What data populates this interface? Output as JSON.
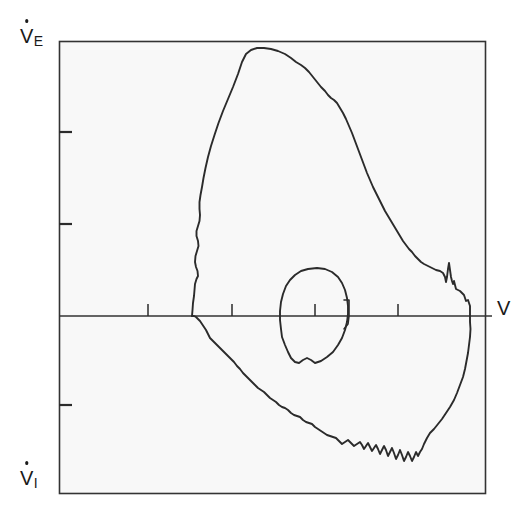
{
  "figure": {
    "background_color": "#ffffff",
    "plot_background_color": "#f8f8f8",
    "line_color": "#2b2b2b"
  },
  "labels": {
    "y_axis_positive": {
      "base": "V",
      "subscript": "E",
      "dot": true,
      "full": "V̇E"
    },
    "y_axis_negative": {
      "base": "V",
      "subscript": "I",
      "dot": true,
      "full": "V̇I"
    },
    "x_axis": {
      "base": "V",
      "subscript": "",
      "dot": false,
      "full": "V"
    }
  },
  "chart_data": {
    "type": "line",
    "xlabel": "V",
    "ylabel": "V̇E / V̇I",
    "grid": false,
    "legend": "none",
    "xlim": [
      59,
      486
    ],
    "ylim": [
      494,
      41
    ],
    "zero_axis_y": 316,
    "plot_box": {
      "x0": 59,
      "y0": 41,
      "x1": 486,
      "y1": 494
    },
    "axis_extension_right_x": 492,
    "y_ticks": [
      {
        "y": 132,
        "length": 13,
        "labeled": false
      },
      {
        "y": 224,
        "length": 13,
        "labeled": false
      },
      {
        "y": 405,
        "length": 13,
        "labeled": false
      }
    ],
    "x_ticks": [
      {
        "x": 148,
        "length": 12,
        "labeled": false
      },
      {
        "x": 232,
        "length": 12,
        "labeled": false
      },
      {
        "x": 315,
        "length": 12,
        "labeled": false
      },
      {
        "x": 398,
        "length": 12,
        "labeled": false
      }
    ],
    "marker": {
      "name": "tidal-volume-bracket",
      "path": "M 344 300 L 349 300 L 349 316 L 348 324 L 344 329"
    },
    "series": [
      {
        "name": "expiratory-limb",
        "description": "Forced expiratory flow, above zero axis",
        "points": [
          [
            192,
            316
          ],
          [
            192.5,
            310
          ],
          [
            193,
            303
          ],
          [
            194,
            296
          ],
          [
            194.5,
            290
          ],
          [
            195,
            284
          ],
          [
            196.5,
            279
          ],
          [
            198,
            276
          ],
          [
            197.5,
            271
          ],
          [
            196,
            267
          ],
          [
            195,
            262
          ],
          [
            195.5,
            256
          ],
          [
            197,
            251
          ],
          [
            198.5,
            246
          ],
          [
            198,
            241
          ],
          [
            196.5,
            236
          ],
          [
            196.5,
            231
          ],
          [
            198,
            226
          ],
          [
            199.5,
            221
          ],
          [
            200,
            215
          ],
          [
            199.5,
            209
          ],
          [
            199.5,
            202
          ],
          [
            200.5,
            195
          ],
          [
            202,
            187
          ],
          [
            203.5,
            178
          ],
          [
            205.5,
            168
          ],
          [
            208,
            157
          ],
          [
            211,
            146
          ],
          [
            214.5,
            135
          ],
          [
            218.5,
            123
          ],
          [
            223,
            111
          ],
          [
            228,
            99
          ],
          [
            233,
            87
          ],
          [
            238,
            74
          ],
          [
            242,
            62
          ],
          [
            246,
            54
          ],
          [
            251,
            50
          ],
          [
            257,
            48
          ],
          [
            264,
            48
          ],
          [
            271,
            49
          ],
          [
            278,
            51
          ],
          [
            285,
            54
          ],
          [
            291,
            58
          ],
          [
            296,
            62
          ],
          [
            301,
            65
          ],
          [
            305,
            68
          ],
          [
            309,
            72
          ],
          [
            313,
            77
          ],
          [
            317,
            82
          ],
          [
            321,
            87
          ],
          [
            325,
            91
          ],
          [
            328,
            95
          ],
          [
            331,
            98
          ],
          [
            334,
            100
          ],
          [
            337,
            103
          ],
          [
            340,
            108
          ],
          [
            343,
            113
          ],
          [
            346,
            119
          ],
          [
            349,
            126
          ],
          [
            352,
            133
          ],
          [
            355,
            141
          ],
          [
            358,
            149
          ],
          [
            361,
            157
          ],
          [
            364,
            165
          ],
          [
            367,
            173
          ],
          [
            370,
            180
          ],
          [
            373,
            187
          ],
          [
            376,
            193
          ],
          [
            379,
            199
          ],
          [
            382,
            205
          ],
          [
            385,
            211
          ],
          [
            388,
            216
          ],
          [
            391,
            221
          ],
          [
            394,
            226
          ],
          [
            397,
            231
          ],
          [
            400,
            236
          ],
          [
            403,
            241
          ],
          [
            406,
            245
          ],
          [
            409,
            249
          ],
          [
            412,
            252
          ],
          [
            415,
            256
          ],
          [
            418,
            259
          ],
          [
            421,
            262
          ],
          [
            424,
            264
          ],
          [
            428,
            266
          ],
          [
            432,
            268
          ],
          [
            436,
            270
          ],
          [
            440,
            271
          ],
          [
            443,
            273
          ],
          [
            445,
            277
          ],
          [
            446,
            282
          ],
          [
            447,
            277
          ],
          [
            448,
            269
          ],
          [
            449,
            263
          ],
          [
            450,
            270
          ],
          [
            451,
            277
          ],
          [
            452,
            281
          ],
          [
            453,
            284
          ],
          [
            454,
            281
          ],
          [
            455,
            285
          ],
          [
            456,
            289
          ],
          [
            458,
            290
          ],
          [
            460,
            291
          ],
          [
            462,
            293
          ],
          [
            464,
            295
          ],
          [
            465,
            298
          ],
          [
            466,
            301
          ],
          [
            468,
            300
          ],
          [
            469,
            303
          ],
          [
            470,
            306
          ],
          [
            470,
            310
          ],
          [
            470,
            316
          ]
        ]
      },
      {
        "name": "inspiratory-limb",
        "description": "Inspiratory flow, below zero axis",
        "points": [
          [
            470,
            316
          ],
          [
            470,
            322
          ],
          [
            470.5,
            329
          ],
          [
            470,
            337
          ],
          [
            469,
            345
          ],
          [
            468,
            353
          ],
          [
            466.5,
            361
          ],
          [
            465,
            369
          ],
          [
            463,
            377
          ],
          [
            460,
            385
          ],
          [
            457,
            393
          ],
          [
            454,
            400
          ],
          [
            450,
            407
          ],
          [
            446,
            413
          ],
          [
            442,
            419
          ],
          [
            438,
            424
          ],
          [
            434,
            429
          ],
          [
            430,
            433
          ],
          [
            427,
            438
          ],
          [
            424,
            444
          ],
          [
            422,
            449
          ],
          [
            420,
            452
          ],
          [
            418,
            456
          ],
          [
            416,
            452
          ],
          [
            414,
            457
          ],
          [
            412,
            461
          ],
          [
            410,
            456
          ],
          [
            408,
            452
          ],
          [
            406,
            457
          ],
          [
            404,
            461
          ],
          [
            402,
            455
          ],
          [
            400,
            450
          ],
          [
            398,
            455
          ],
          [
            396,
            459
          ],
          [
            394,
            453
          ],
          [
            392,
            448
          ],
          [
            390,
            452
          ],
          [
            388,
            456
          ],
          [
            386,
            450
          ],
          [
            384,
            446
          ],
          [
            382,
            450
          ],
          [
            380,
            454
          ],
          [
            378,
            449
          ],
          [
            376,
            445
          ],
          [
            374,
            448
          ],
          [
            372,
            451
          ],
          [
            370,
            447
          ],
          [
            368,
            443
          ],
          [
            366,
            446
          ],
          [
            364,
            449
          ],
          [
            362,
            445
          ],
          [
            360,
            442
          ],
          [
            357,
            444
          ],
          [
            354,
            446
          ],
          [
            351,
            443
          ],
          [
            348,
            440
          ],
          [
            345,
            442
          ],
          [
            342,
            444
          ],
          [
            339,
            441
          ],
          [
            336,
            438
          ],
          [
            333,
            437
          ],
          [
            330,
            436
          ],
          [
            327,
            435
          ],
          [
            324,
            433
          ],
          [
            321,
            431
          ],
          [
            318,
            429
          ],
          [
            315,
            427
          ],
          [
            312,
            424
          ],
          [
            309,
            423
          ],
          [
            306,
            422
          ],
          [
            303,
            420
          ],
          [
            300,
            417
          ],
          [
            297,
            416
          ],
          [
            294,
            415
          ],
          [
            291,
            413
          ],
          [
            288,
            410
          ],
          [
            285,
            408
          ],
          [
            282,
            407
          ],
          [
            279,
            405
          ],
          [
            276,
            402
          ],
          [
            273,
            400
          ],
          [
            270,
            398
          ],
          [
            267,
            395
          ],
          [
            264,
            392
          ],
          [
            261,
            390
          ],
          [
            258,
            388
          ],
          [
            255,
            385
          ],
          [
            252,
            382
          ],
          [
            249,
            379
          ],
          [
            246,
            376
          ],
          [
            243,
            373
          ],
          [
            240,
            369
          ],
          [
            237,
            366
          ],
          [
            234,
            362
          ],
          [
            231,
            359
          ],
          [
            228,
            356
          ],
          [
            225,
            353
          ],
          [
            222,
            350
          ],
          [
            219,
            347
          ],
          [
            216,
            344
          ],
          [
            213,
            341
          ],
          [
            210,
            338
          ],
          [
            208,
            334
          ],
          [
            206,
            330
          ],
          [
            204,
            327
          ],
          [
            202,
            324
          ],
          [
            200,
            321
          ],
          [
            198,
            319
          ],
          [
            196,
            317
          ],
          [
            194,
            316
          ],
          [
            192,
            316
          ]
        ]
      },
      {
        "name": "tidal-breathing-loop",
        "description": "Small inner resting tidal volume loop",
        "closed": true,
        "points": [
          [
            317,
            268
          ],
          [
            325,
            269
          ],
          [
            332,
            272
          ],
          [
            338,
            277
          ],
          [
            342,
            283
          ],
          [
            345,
            290
          ],
          [
            347,
            298
          ],
          [
            348,
            306
          ],
          [
            348,
            314
          ],
          [
            347,
            322
          ],
          [
            345,
            330
          ],
          [
            342,
            338
          ],
          [
            338,
            345
          ],
          [
            333,
            352
          ],
          [
            327,
            357
          ],
          [
            321,
            361
          ],
          [
            315,
            363
          ],
          [
            311,
            360
          ],
          [
            307,
            358
          ],
          [
            303,
            360
          ],
          [
            299,
            363
          ],
          [
            295,
            362
          ],
          [
            291,
            358
          ],
          [
            288,
            352
          ],
          [
            285,
            345
          ],
          [
            282,
            337
          ],
          [
            281,
            329
          ],
          [
            280,
            320
          ],
          [
            280,
            311
          ],
          [
            281,
            302
          ],
          [
            283,
            294
          ],
          [
            286,
            286
          ],
          [
            290,
            280
          ],
          [
            295,
            275
          ],
          [
            301,
            271
          ],
          [
            308,
            269
          ],
          [
            317,
            268
          ]
        ]
      }
    ]
  }
}
